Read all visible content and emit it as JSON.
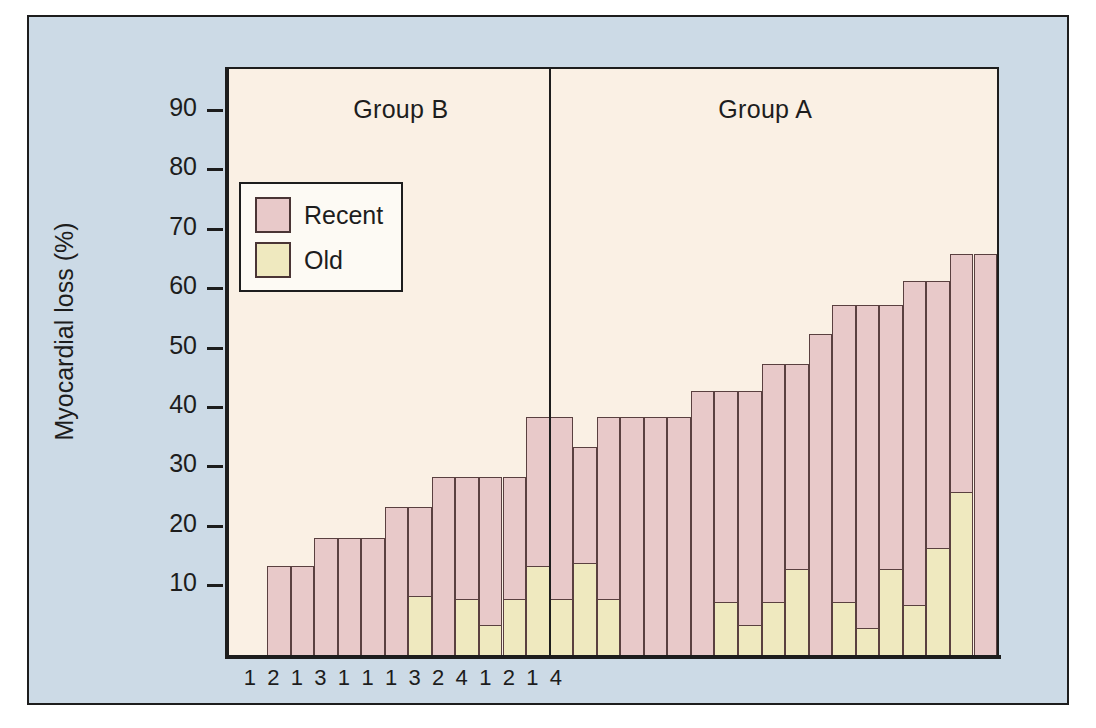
{
  "figure": {
    "background_color": "#ccdae6",
    "plot_background_color": "#faf0e4",
    "frame_color": "#1d1d1d"
  },
  "axes": {
    "y_title": "Myocardial loss (%)",
    "y_ticks": [
      "90",
      "80",
      "70",
      "60",
      "50",
      "40",
      "30",
      "20",
      "10"
    ],
    "y_tick_values": [
      90,
      80,
      70,
      60,
      50,
      40,
      30,
      20,
      10
    ],
    "x_tick_labels": [
      "1",
      "2",
      "1",
      "3",
      "1",
      "1",
      "1",
      "3",
      "2",
      "4",
      "1",
      "2",
      "1",
      "4"
    ]
  },
  "groups": [
    {
      "name": "group-b",
      "label": "Group B"
    },
    {
      "name": "group-a",
      "label": "Group A"
    }
  ],
  "legend": {
    "entries": [
      {
        "key": "recent",
        "label": "Recent",
        "color": "#e8c9c9"
      },
      {
        "key": "old",
        "label": "Old",
        "color": "#efe9bf"
      }
    ]
  },
  "chart_data": {
    "type": "bar",
    "subtype": "stacked",
    "title": "",
    "xlabel": "",
    "ylabel": "Myocardial loss (%)",
    "ylim": [
      0,
      97
    ],
    "grid": false,
    "legend_position": "upper-left-inside",
    "series": [
      {
        "name": "Old",
        "color": "#efe9bf",
        "values": [
          0,
          0,
          0,
          0,
          0,
          0,
          10,
          0,
          9.5,
          5,
          9.5,
          15,
          9.5,
          15.5,
          9.5,
          0,
          0,
          0,
          0,
          9,
          5,
          9,
          14.5,
          0,
          9,
          4.5,
          14.5,
          8.5,
          18,
          27.5,
          0
        ]
      },
      {
        "name": "Recent",
        "color": "#e8c9c9",
        "values": [
          15,
          15,
          19.7,
          19.7,
          19.7,
          25,
          15,
          30,
          20.5,
          25,
          20.5,
          25,
          30.5,
          19.5,
          30.5,
          40,
          40,
          40,
          44.5,
          35.5,
          39.5,
          40,
          34.5,
          54,
          50,
          54.5,
          44.5,
          54.5,
          45,
          40,
          67.5
        ]
      }
    ],
    "totals": [
      15,
      15,
      19.7,
      19.7,
      19.7,
      25,
      25,
      30,
      30,
      30,
      30,
      40,
      40,
      35,
      40,
      40,
      40,
      40,
      44.5,
      44.5,
      44.5,
      49,
      49,
      54,
      59,
      59,
      59,
      63,
      63,
      67.5,
      67.5
    ],
    "group_split_index": 12,
    "n_bars": 31
  }
}
